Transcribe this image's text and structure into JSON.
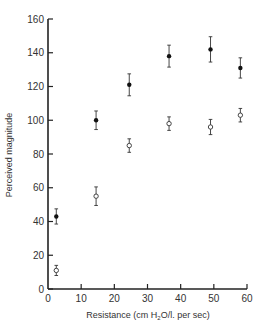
{
  "chart_data": {
    "type": "scatter",
    "title": "",
    "xlabel": "Resistance (cm H2O/l. per sec)",
    "ylabel": "Perceived magnitude",
    "xlim": [
      0,
      60
    ],
    "ylim": [
      0,
      160
    ],
    "xticks": [
      0,
      10,
      20,
      30,
      40,
      50,
      60
    ],
    "yticks": [
      0,
      20,
      40,
      60,
      80,
      100,
      120,
      140,
      160
    ],
    "grid": false,
    "legend": null,
    "series": [
      {
        "name": "filled",
        "marker": "filled-circle",
        "x": [
          2.5,
          14.5,
          24.5,
          36.5,
          49,
          58
        ],
        "y": [
          43,
          100,
          121,
          138,
          142,
          131
        ],
        "err": [
          4.5,
          5.5,
          6.5,
          6.5,
          7.5,
          6
        ]
      },
      {
        "name": "open",
        "marker": "open-circle",
        "x": [
          2.5,
          14.5,
          24.5,
          36.5,
          49,
          58
        ],
        "y": [
          11,
          55,
          85,
          98,
          96,
          103
        ],
        "err": [
          3,
          5.5,
          4,
          4,
          4.5,
          4
        ]
      }
    ]
  },
  "labels": {
    "xlabel_pre": "Resistance (cm H",
    "xlabel_sub": "2",
    "xlabel_post": "O/l. per sec)",
    "ylabel": "Perceived magnitude"
  }
}
